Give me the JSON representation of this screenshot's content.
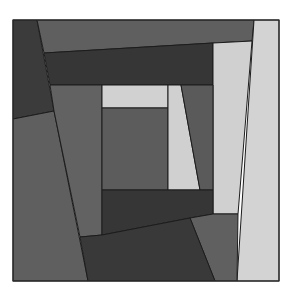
{
  "artwork": {
    "kind": "abstract geometric grayscale composition (log-cabin quilt style)",
    "width": 302,
    "height": 292,
    "background": "#ffffff",
    "frame": {
      "x": 13,
      "y": 20,
      "w": 266,
      "h": 261,
      "stroke": "#2a2a2a"
    },
    "palette": {
      "dark": "#3a3a3a",
      "darker": "#333333",
      "mid": "#5e5e5e",
      "mid_light": "#666666",
      "light": "#d2d2d2",
      "edge": "#1c1c1c"
    },
    "shapes": [
      {
        "name": "left-dark-strip",
        "fill": "#3b3b3b",
        "points": "13,20 37,20 54,111 13,119"
      },
      {
        "name": "top-mid-band",
        "fill": "#5f5f5f",
        "points": "37,20 254,20 252,41 213,43 44,53"
      },
      {
        "name": "top-dark-band",
        "fill": "#363636",
        "points": "44,53 213,43 213,85 50,85"
      },
      {
        "name": "right-light-column",
        "fill": "#d3d3d3",
        "points": "254,20 279,20 279,281 237,281"
      },
      {
        "name": "inner-light-column",
        "fill": "#d0d0d0",
        "points": "213,43 252,41 238,214 213,214"
      },
      {
        "name": "left-large-mid",
        "fill": "#5f5f5f",
        "points": "13,119 54,111 88,281 13,281"
      },
      {
        "name": "inner-left-mid",
        "fill": "#626262",
        "points": "50,85 102,85 102,235 80,237 54,111"
      },
      {
        "name": "center-light-top",
        "fill": "#d1d1d1",
        "points": "102,85 168,85 168,108 102,108"
      },
      {
        "name": "center-mid-square",
        "fill": "#5c5c5c",
        "points": "102,108 168,108 168,190 102,190"
      },
      {
        "name": "light-trapezoid",
        "fill": "#d0d0d0",
        "points": "168,85 181,85 200,190 168,190"
      },
      {
        "name": "mid-wedge",
        "fill": "#5a5a5a",
        "points": "181,85 213,85 213,190 200,190"
      },
      {
        "name": "bottom-dark-band",
        "fill": "#363636",
        "points": "102,190 213,190 213,214 190,218 102,235"
      },
      {
        "name": "bottom-right-mid",
        "fill": "#606060",
        "points": "190,218 213,214 238,214 237,281 215,281"
      },
      {
        "name": "bottom-dark-block",
        "fill": "#393939",
        "points": "80,237 102,235 190,218 215,281 88,281"
      }
    ]
  }
}
